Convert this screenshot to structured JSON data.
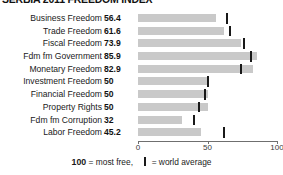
{
  "title": "SERBIA 2011 FREEDOM INDEX",
  "axis": {
    "ticks": [
      0,
      50,
      100
    ],
    "min": 0,
    "max": 100
  },
  "legend": {
    "most_free_value": "100",
    "most_free_text": "= most free,",
    "world_average_text": "= world average"
  },
  "colors": {
    "bar": "#c9c9c9",
    "tick": "#191919",
    "axis": "#6f6f6f",
    "text": "#1a1a1a"
  },
  "chart_data": {
    "type": "bar",
    "title": "SERBIA 2011 FREEDOM INDEX",
    "xlabel": "",
    "ylabel": "",
    "xlim": [
      0,
      100
    ],
    "grid": false,
    "orientation": "horizontal",
    "legend_position": "bottom",
    "categories": [
      "Business Freedom",
      "Trade Freedom",
      "Fiscal Freedom",
      "Fdm fm Government",
      "Monetary Freedom",
      "Investment Freedom",
      "Financial Freedom",
      "Property Rights",
      "Fdm fm Corruption",
      "Labor Freedom"
    ],
    "values": [
      56.4,
      61.6,
      73.9,
      85.9,
      82.9,
      50,
      50,
      50,
      32,
      45.2
    ],
    "value_labels": [
      "56.4",
      "61.6",
      "73.9",
      "85.9",
      "82.9",
      "50",
      "50",
      "50",
      "32",
      "45.2"
    ],
    "series": [
      {
        "name": "Score",
        "values": [
          56.4,
          61.6,
          73.9,
          85.9,
          82.9,
          50,
          50,
          50,
          32,
          45.2
        ]
      },
      {
        "name": "World average",
        "marker": "vertical-tick",
        "values": [
          64,
          66,
          76,
          81,
          74,
          50,
          48,
          44,
          40,
          62
        ]
      }
    ]
  }
}
